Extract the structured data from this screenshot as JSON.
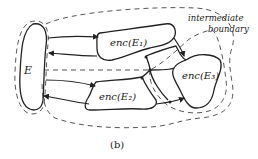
{
  "figure": {
    "caption": "(b)",
    "annotation": {
      "line1": "intermediate",
      "line2": "boundary"
    },
    "nodes": {
      "E": "E",
      "enc1": "enc(E₁)",
      "enc2": "enc(E₂)",
      "enc3": "enc(E₃)"
    },
    "colors": {
      "stroke": "#222222",
      "background": "#ffffff"
    }
  }
}
